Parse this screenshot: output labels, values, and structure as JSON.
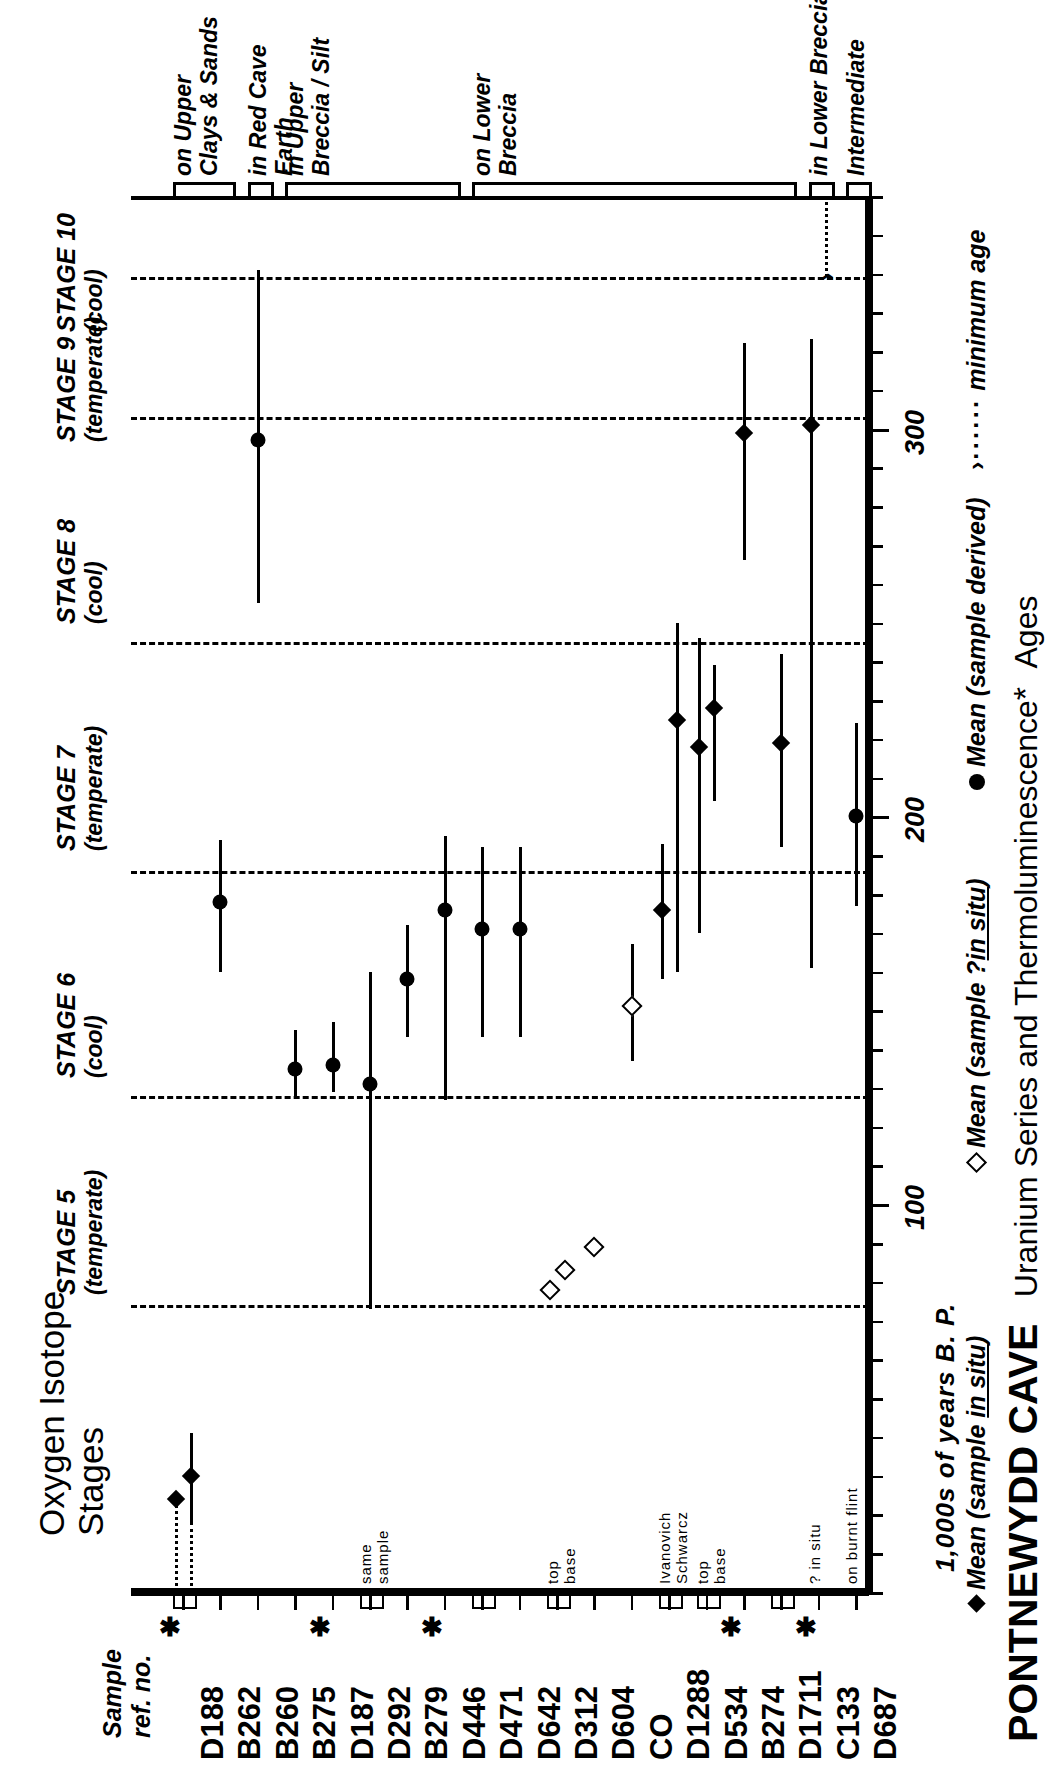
{
  "title": {
    "main": "PONTNEWYDD CAVE",
    "sub": "Uranium Series and Thermoluminescence",
    "sub2": "Ages",
    "asterisk": "*"
  },
  "axis": {
    "label": "1,000s of years B. P.",
    "ticks": [
      0,
      10,
      20,
      30,
      40,
      50,
      60,
      70,
      80,
      90,
      100,
      110,
      120,
      130,
      140,
      150,
      160,
      170,
      180,
      190,
      200,
      210,
      220,
      230,
      240,
      250,
      260,
      270,
      280,
      290,
      300,
      310,
      320,
      330,
      340,
      350,
      360
    ],
    "major_labels": [
      {
        "value": 100,
        "text": "100"
      },
      {
        "value": 200,
        "text": "200"
      },
      {
        "value": 300,
        "text": "300"
      }
    ],
    "min": 0,
    "max": 360
  },
  "corner": {
    "oxygen_line1": "Oxygen Isotope",
    "oxygen_line2": "Stages",
    "sample_line1": "Sample",
    "sample_line2": "ref. no."
  },
  "stages": [
    {
      "name": "STAGE 5",
      "sub": "(temperate)",
      "start": 74,
      "end": 128
    },
    {
      "name": "STAGE 6",
      "sub": "(cool)",
      "start": 128,
      "end": 186
    },
    {
      "name": "STAGE 7",
      "sub": "(temperate)",
      "start": 186,
      "end": 245
    },
    {
      "name": "STAGE 8",
      "sub": "(cool)",
      "start": 245,
      "end": 303
    },
    {
      "name": "STAGE 9",
      "sub": "(temperate)",
      "start": 303,
      "end": 339
    },
    {
      "name": "STAGE 10",
      "sub": "(cool)",
      "start": 339,
      "end": 360
    }
  ],
  "stage_boundaries": [
    74,
    128,
    186,
    245,
    303,
    339
  ],
  "units": [
    {
      "label": "on Upper\nClays & Sands",
      "from": "D188",
      "to": "B262"
    },
    {
      "label": "in Red Cave\nEarth",
      "from": "B260",
      "to": "B260"
    },
    {
      "label": "in Upper\nBreccia / Silt",
      "from": "B275",
      "to": "D446"
    },
    {
      "label": "on Lower\nBreccia",
      "from": "D471",
      "to": "D1711"
    },
    {
      "label": "in Lower Breccia",
      "from": "C133",
      "to": "C133"
    },
    {
      "label": "Intermediate",
      "from": "D687",
      "to": "D687"
    }
  ],
  "legend": [
    {
      "symbol": "filled-diamond",
      "text": "Mean (sample in situ)",
      "underline": "in situ"
    },
    {
      "symbol": "open-diamond",
      "text": "Mean (sample ?in situ)",
      "underline": "in situ"
    },
    {
      "symbol": "filled-circle",
      "text": "Mean (sample derived)",
      "underline": ""
    },
    {
      "symbol": "arrow-dotted",
      "text": "minimum age",
      "underline": ""
    }
  ],
  "chart_data": {
    "type": "range",
    "title": "PONTNEWYDD CAVE  Uranium Series and Thermoluminescence* Ages",
    "xlabel": "1,000s of years B. P.",
    "ylabel": "Sample ref. no.",
    "xlim": [
      0,
      360
    ],
    "grid": "stage boundary dashed lines at 74, 128, 186, 245, 303, 339 ka",
    "orientation": "horizontal-rows (figure printed rotated 90 degrees)",
    "categories": [
      "D188",
      "B262",
      "B260",
      "B275",
      "D187",
      "D292",
      "B279",
      "D446",
      "D471",
      "D642",
      "D312",
      "D604",
      "CO",
      "D1288",
      "D534",
      "B274",
      "D1711",
      "C133",
      "D687"
    ],
    "points": [
      {
        "sample": "D188",
        "note": "",
        "marker": "filled-diamond",
        "mean": 24,
        "low": 24,
        "high": 24,
        "bar": "dotted",
        "bar_low": 0,
        "bar_high": 24,
        "asterisk": true,
        "group": "on Upper Clays & Sands"
      },
      {
        "sample": "D188",
        "note": "second",
        "marker": "filled-diamond",
        "mean": 30,
        "low": 18,
        "high": 41,
        "bar": "dotted+solid",
        "bar_low": 0,
        "bar_high": 41,
        "asterisk": true,
        "group": "on Upper Clays & Sands"
      },
      {
        "sample": "B262",
        "note": "",
        "marker": "filled-circle",
        "mean": 178,
        "low": 160,
        "high": 194,
        "bar": "solid",
        "bar_low": 160,
        "bar_high": 194,
        "asterisk": false,
        "group": "on Upper Clays & Sands"
      },
      {
        "sample": "B260",
        "note": "",
        "marker": "filled-circle",
        "mean": 297,
        "low": 255,
        "high": 341,
        "bar": "solid",
        "bar_low": 255,
        "bar_high": 341,
        "asterisk": false,
        "group": "in Red Cave Earth"
      },
      {
        "sample": "B275",
        "note": "",
        "marker": "filled-circle",
        "mean": 135,
        "low": 128,
        "high": 145,
        "bar": "solid",
        "bar_low": 128,
        "bar_high": 145,
        "asterisk": false,
        "group": "in Upper Breccia / Silt"
      },
      {
        "sample": "D187",
        "note": "",
        "marker": "filled-circle",
        "mean": 136,
        "low": 129,
        "high": 147,
        "bar": "solid",
        "bar_low": 129,
        "bar_high": 147,
        "asterisk": false,
        "group": "in Upper Breccia / Silt"
      },
      {
        "sample": "D292",
        "note": "same sample",
        "marker": "filled-circle",
        "mean": 131,
        "low": 73,
        "high": 160,
        "bar": "solid",
        "bar_low": 73,
        "bar_high": 160,
        "asterisk": true,
        "group": "in Upper Breccia / Silt"
      },
      {
        "sample": "B279",
        "note": "",
        "marker": "filled-circle",
        "mean": 158,
        "low": 143,
        "high": 172,
        "bar": "solid",
        "bar_low": 143,
        "bar_high": 172,
        "asterisk": false,
        "group": "in Upper Breccia / Silt"
      },
      {
        "sample": "D446",
        "note": "",
        "marker": "filled-circle",
        "mean": 176,
        "low": 127,
        "high": 195,
        "bar": "solid",
        "bar_low": 127,
        "bar_high": 195,
        "asterisk": false,
        "group": "in Upper Breccia / Silt"
      },
      {
        "sample": "D471",
        "note": "",
        "marker": "filled-circle",
        "mean": 171,
        "low": 143,
        "high": 192,
        "bar": "solid",
        "bar_low": 143,
        "bar_high": 192,
        "asterisk": true,
        "group": "on Lower Breccia"
      },
      {
        "sample": "D642",
        "note": "",
        "marker": "filled-circle",
        "mean": 171,
        "low": 143,
        "high": 192,
        "bar": "solid",
        "bar_low": 143,
        "bar_high": 192,
        "asterisk": false,
        "group": "on Lower Breccia"
      },
      {
        "sample": "D312",
        "note": "top",
        "marker": "open-diamond",
        "mean": 78,
        "low": 78,
        "high": 78,
        "bar": "none",
        "bar_low": 78,
        "bar_high": 78,
        "asterisk": false,
        "group": "on Lower Breccia"
      },
      {
        "sample": "D312",
        "note": "base",
        "marker": "open-diamond",
        "mean": 83,
        "low": 83,
        "high": 83,
        "bar": "none",
        "bar_low": 83,
        "bar_high": 83,
        "asterisk": false,
        "group": "on Lower Breccia"
      },
      {
        "sample": "D604",
        "note": "",
        "marker": "open-diamond",
        "mean": 89,
        "low": 89,
        "high": 89,
        "bar": "none",
        "bar_low": 89,
        "bar_high": 89,
        "asterisk": false,
        "group": "on Lower Breccia"
      },
      {
        "sample": "CO",
        "note": "",
        "marker": "open-diamond",
        "mean": 151,
        "low": 137,
        "high": 167,
        "bar": "solid",
        "bar_low": 137,
        "bar_high": 167,
        "asterisk": false,
        "group": "on Lower Breccia"
      },
      {
        "sample": "D1288",
        "note": "Ivanovich",
        "marker": "filled-diamond",
        "mean": 176,
        "low": 158,
        "high": 193,
        "bar": "solid",
        "bar_low": 158,
        "bar_high": 193,
        "asterisk": false,
        "group": "on Lower Breccia"
      },
      {
        "sample": "D1288",
        "note": "Schwarcz",
        "marker": "filled-diamond",
        "mean": 225,
        "low": 160,
        "high": 250,
        "bar": "solid",
        "bar_low": 160,
        "bar_high": 250,
        "asterisk": false,
        "group": "on Lower Breccia"
      },
      {
        "sample": "D534",
        "note": "top",
        "marker": "filled-diamond",
        "mean": 218,
        "low": 170,
        "high": 246,
        "bar": "solid",
        "bar_low": 170,
        "bar_high": 246,
        "asterisk": false,
        "group": "on Lower Breccia"
      },
      {
        "sample": "D534",
        "note": "base",
        "marker": "filled-diamond",
        "mean": 228,
        "low": 204,
        "high": 239,
        "bar": "solid",
        "bar_low": 204,
        "bar_high": 239,
        "asterisk": false,
        "group": "on Lower Breccia"
      },
      {
        "sample": "B274",
        "note": "",
        "marker": "filled-diamond",
        "mean": 299,
        "low": 266,
        "high": 322,
        "bar": "solid",
        "bar_low": 266,
        "bar_high": 322,
        "asterisk": false,
        "group": "on Lower Breccia"
      },
      {
        "sample": "D1711",
        "note": "",
        "marker": "filled-diamond",
        "mean": 219,
        "low": 192,
        "high": 242,
        "bar": "solid",
        "bar_low": 192,
        "bar_high": 242,
        "asterisk": true,
        "group": "on Lower Breccia"
      },
      {
        "sample": "C133",
        "note": "? in situ",
        "marker": "filled-diamond",
        "mean": 301,
        "low": 161,
        "high": 323,
        "bar": "solid",
        "bar_low": 161,
        "bar_high": 323,
        "asterisk": false,
        "group": "in Lower Breccia"
      },
      {
        "sample": "C133",
        "note": "minimum",
        "marker": "arrow",
        "mean": 339,
        "low": 339,
        "high": 360,
        "bar": "dotted",
        "bar_low": 339,
        "bar_high": 360,
        "asterisk": false,
        "group": "in Lower Breccia"
      },
      {
        "sample": "D687",
        "note": "on burnt flint",
        "marker": "filled-circle",
        "mean": 200,
        "low": 177,
        "high": 224,
        "bar": "solid",
        "bar_low": 177,
        "bar_high": 224,
        "asterisk": true,
        "group": "Intermediate"
      }
    ]
  },
  "samples": [
    {
      "id": "D188",
      "annot": "",
      "asterisk": true,
      "pair": true
    },
    {
      "id": "B262",
      "annot": "",
      "asterisk": false,
      "pair": false
    },
    {
      "id": "B260",
      "annot": "",
      "asterisk": false,
      "pair": false
    },
    {
      "id": "B275",
      "annot": "",
      "asterisk": false,
      "pair": false
    },
    {
      "id": "D187",
      "annot": "",
      "asterisk": true,
      "pair": false
    },
    {
      "id": "D292",
      "annot": "same\nsample",
      "asterisk": false,
      "pair": true
    },
    {
      "id": "B279",
      "annot": "",
      "asterisk": false,
      "pair": false
    },
    {
      "id": "D446",
      "annot": "",
      "asterisk": true,
      "pair": false
    },
    {
      "id": "D471",
      "annot": "",
      "asterisk": false,
      "pair": true
    },
    {
      "id": "D642",
      "annot": "",
      "asterisk": false,
      "pair": false
    },
    {
      "id": "D312",
      "annot": "top\nbase",
      "asterisk": false,
      "pair": true
    },
    {
      "id": "D604",
      "annot": "",
      "asterisk": false,
      "pair": false
    },
    {
      "id": "CO",
      "annot": "",
      "asterisk": false,
      "pair": false
    },
    {
      "id": "D1288",
      "annot": "Ivanovich\nSchwarcz",
      "asterisk": false,
      "pair": true
    },
    {
      "id": "D534",
      "annot": "top\nbase",
      "asterisk": false,
      "pair": true
    },
    {
      "id": "B274",
      "annot": "",
      "asterisk": true,
      "pair": false
    },
    {
      "id": "D1711",
      "annot": "",
      "asterisk": false,
      "pair": true
    },
    {
      "id": "C133",
      "annot": "? in situ",
      "asterisk": true,
      "pair": false
    },
    {
      "id": "D687",
      "annot": "on burnt flint",
      "asterisk": false,
      "pair": false
    }
  ]
}
